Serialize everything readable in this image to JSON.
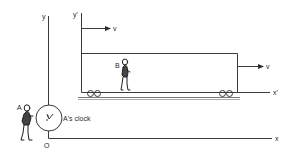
{
  "diagram": {
    "frames": {
      "stationary": {
        "y_axis_label": "y",
        "x_axis_label": "x",
        "origin_label": "O"
      },
      "moving": {
        "y_axis_label": "y'",
        "x_axis_label": "x'"
      }
    },
    "velocity": {
      "top_arrow_label": "v",
      "right_arrow_label": "v"
    },
    "observers": {
      "a_label": "A",
      "b_label": "B"
    },
    "clock": {
      "label": "A's clock"
    },
    "colors": {
      "line": "#3a3a3a",
      "background": "#ffffff"
    }
  }
}
